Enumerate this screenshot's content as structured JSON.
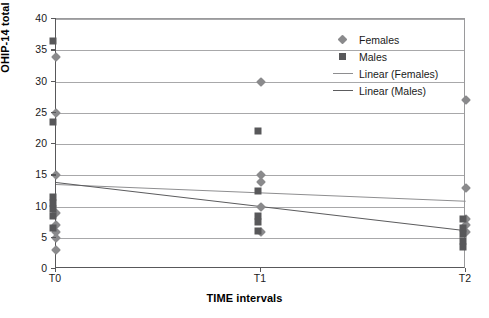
{
  "chart_data": {
    "type": "scatter",
    "title": "",
    "xlabel": "TIME intervals",
    "ylabel": "OHIP-14 total score",
    "categories": [
      "T0",
      "T1",
      "T2"
    ],
    "ylim": [
      0,
      40
    ],
    "yticks": [
      0,
      5,
      10,
      15,
      20,
      25,
      30,
      35,
      40
    ],
    "grid": true,
    "legend_position": "top-right",
    "legend": [
      {
        "label": "Females",
        "marker": "diamond",
        "color": "#8a8a8c"
      },
      {
        "label": "Males",
        "marker": "square",
        "color": "#58585a"
      },
      {
        "label": "Linear (Females)",
        "marker": "line",
        "color": "#8e8e90"
      },
      {
        "label": "Linear (Males)",
        "marker": "line",
        "color": "#5c5c5e"
      }
    ],
    "series": [
      {
        "name": "Females",
        "marker": "diamond",
        "color": "#8a8a8c",
        "points": [
          {
            "x": "T0",
            "y": 34
          },
          {
            "x": "T0",
            "y": 25
          },
          {
            "x": "T0",
            "y": 15
          },
          {
            "x": "T0",
            "y": 9
          },
          {
            "x": "T0",
            "y": 7
          },
          {
            "x": "T0",
            "y": 6
          },
          {
            "x": "T0",
            "y": 5
          },
          {
            "x": "T0",
            "y": 3
          },
          {
            "x": "T1",
            "y": 30
          },
          {
            "x": "T1",
            "y": 15
          },
          {
            "x": "T1",
            "y": 14
          },
          {
            "x": "T1",
            "y": 10
          },
          {
            "x": "T1",
            "y": 6
          },
          {
            "x": "T2",
            "y": 27
          },
          {
            "x": "T2",
            "y": 13
          },
          {
            "x": "T2",
            "y": 8
          },
          {
            "x": "T2",
            "y": 7
          },
          {
            "x": "T2",
            "y": 6
          }
        ]
      },
      {
        "name": "Males",
        "marker": "square",
        "color": "#58585a",
        "points": [
          {
            "x": "T0",
            "y": 36
          },
          {
            "x": "T0",
            "y": 23
          },
          {
            "x": "T0",
            "y": 11
          },
          {
            "x": "T0",
            "y": 10
          },
          {
            "x": "T0",
            "y": 9
          },
          {
            "x": "T0",
            "y": 8
          },
          {
            "x": "T0",
            "y": 6
          },
          {
            "x": "T1",
            "y": 21.5
          },
          {
            "x": "T1",
            "y": 12
          },
          {
            "x": "T1",
            "y": 8
          },
          {
            "x": "T1",
            "y": 7
          },
          {
            "x": "T1",
            "y": 5.5
          },
          {
            "x": "T2",
            "y": 7.5
          },
          {
            "x": "T2",
            "y": 6
          },
          {
            "x": "T2",
            "y": 5
          },
          {
            "x": "T2",
            "y": 4
          },
          {
            "x": "T2",
            "y": 3
          }
        ]
      }
    ],
    "trendlines": [
      {
        "name": "Linear (Females)",
        "color": "#8e8e90",
        "y_start": 13.6,
        "y_end": 10.9
      },
      {
        "name": "Linear (Males)",
        "color": "#5c5c5e",
        "y_start": 13.9,
        "y_end": 6.2
      }
    ]
  }
}
